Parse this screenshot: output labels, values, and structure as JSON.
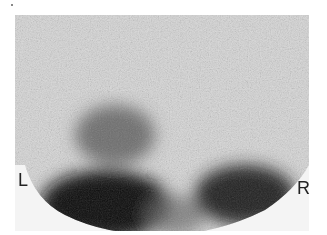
{
  "image": {
    "type": "scintigraphy-scan",
    "labels": {
      "left": "L",
      "right": "R"
    }
  }
}
